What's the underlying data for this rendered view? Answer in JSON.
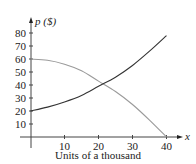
{
  "chart_data": {
    "type": "line",
    "title": "",
    "xlabel": "Units of a thousand",
    "ylabel": "p ($)",
    "x_axis_var": "x",
    "xlim": [
      0,
      42
    ],
    "ylim": [
      0,
      85
    ],
    "x_ticks": [
      10,
      20,
      30,
      40
    ],
    "y_ticks": [
      10,
      20,
      30,
      40,
      50,
      60,
      70,
      80
    ],
    "grid": false,
    "legend": null,
    "series": [
      {
        "name": "demand",
        "color": "#9a9a9a",
        "x": [
          0,
          5,
          10,
          15,
          20,
          25,
          30,
          35,
          40
        ],
        "y": [
          60,
          59,
          56,
          51,
          43,
          35,
          25,
          13,
          0
        ]
      },
      {
        "name": "supply",
        "color": "#333333",
        "x": [
          0,
          5,
          10,
          15,
          20,
          25,
          30,
          35,
          40
        ],
        "y": [
          20,
          23,
          27,
          32,
          39,
          46,
          55,
          66,
          78
        ]
      }
    ]
  }
}
